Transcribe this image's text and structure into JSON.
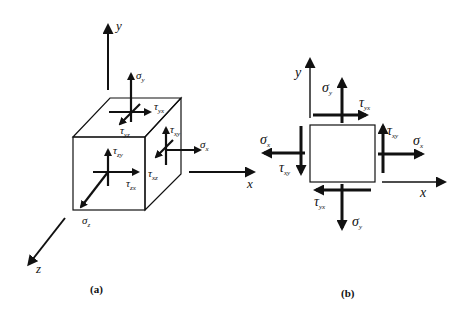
{
  "colors": {
    "face_fill": "#a8a8a8",
    "line": "#111111",
    "background": "#ffffff"
  },
  "panel_a": {
    "caption": "(a)",
    "axes": {
      "x": "x",
      "y": "y",
      "z": "z"
    },
    "labels": {
      "sigma_y": {
        "main": "σ",
        "sub": "y"
      },
      "tau_yx": {
        "main": "τ",
        "sub": "yx"
      },
      "tau_yz": {
        "main": "τ",
        "sub": "yz"
      },
      "tau_xy": {
        "main": "τ",
        "sub": "xy"
      },
      "sigma_x": {
        "main": "σ",
        "sub": "x"
      },
      "tau_xz": {
        "main": "τ",
        "sub": "xz"
      },
      "tau_zy": {
        "main": "τ",
        "sub": "zy"
      },
      "tau_zx": {
        "main": "τ",
        "sub": "zx"
      },
      "sigma_z": {
        "main": "σ",
        "sub": "z"
      }
    }
  },
  "panel_b": {
    "caption": "(b)",
    "axes": {
      "x": "x",
      "y": "y"
    },
    "labels": {
      "sigma_y_top": {
        "main": "σ",
        "sub": "y"
      },
      "tau_yx_top": {
        "main": "τ",
        "sub": "yx"
      },
      "tau_xy_right": {
        "main": "τ",
        "sub": "xy"
      },
      "sigma_x_right": {
        "main": "σ",
        "sub": "x"
      },
      "sigma_x_left": {
        "main": "σ",
        "sub": "x"
      },
      "tau_xy_left": {
        "main": "τ",
        "sub": "xy"
      },
      "tau_yx_bottom": {
        "main": "τ",
        "sub": "yx"
      },
      "sigma_y_bottom": {
        "main": "σ",
        "sub": "y"
      }
    }
  }
}
